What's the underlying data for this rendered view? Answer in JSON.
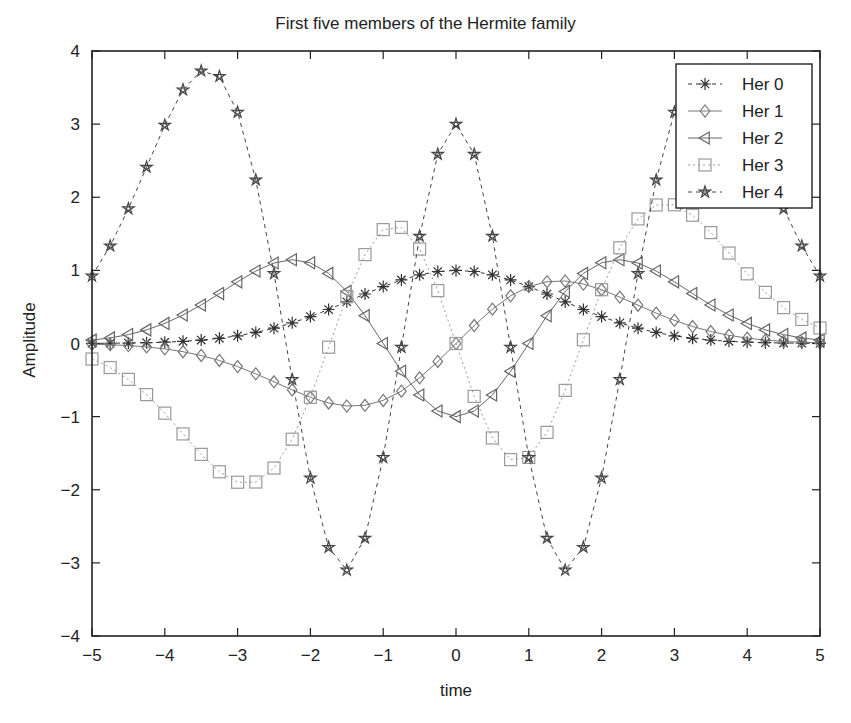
{
  "chart_data": {
    "type": "line",
    "title": "First five members of the Hermite family",
    "xlabel": "time",
    "ylabel": "Amplitude",
    "xlim": [
      -5,
      5
    ],
    "ylim": [
      -4,
      4
    ],
    "xticks": [
      -5,
      -4,
      -3,
      -2,
      -1,
      0,
      1,
      2,
      3,
      4,
      5
    ],
    "yticks": [
      -4,
      -3,
      -2,
      -1,
      0,
      1,
      2,
      3,
      4
    ],
    "xtick_labels": [
      "−5",
      "−4",
      "−3",
      "−2",
      "−1",
      "0",
      "1",
      "2",
      "3",
      "4",
      "5"
    ],
    "ytick_labels": [
      "−4",
      "−3",
      "−2",
      "−1",
      "0",
      "1",
      "2",
      "3",
      "4"
    ],
    "grid": false,
    "legend_position": "upper right",
    "x": [
      -5,
      -4.75,
      -4.5,
      -4.25,
      -4,
      -3.75,
      -3.5,
      -3.25,
      -3,
      -2.75,
      -2.5,
      -2.25,
      -2,
      -1.75,
      -1.5,
      -1.25,
      -1,
      -0.75,
      -0.5,
      -0.25,
      0,
      0.25,
      0.5,
      0.75,
      1,
      1.25,
      1.5,
      1.75,
      2,
      2.25,
      2.5,
      2.75,
      3,
      3.25,
      3.5,
      3.75,
      4,
      4.25,
      4.5,
      4.75,
      5
    ],
    "series": [
      {
        "name": "Her 0",
        "marker": "asterisk",
        "line": "dashed",
        "color": "#333333",
        "values": [
          0.0019,
          0.0035,
          0.0063,
          0.0109,
          0.0183,
          0.0298,
          0.0468,
          0.0714,
          0.1054,
          0.151,
          0.2096,
          0.2821,
          0.3679,
          0.4648,
          0.5698,
          0.6766,
          0.7788,
          0.8688,
          0.9394,
          0.9845,
          1.0,
          0.9845,
          0.9394,
          0.8688,
          0.7788,
          0.6766,
          0.5698,
          0.4648,
          0.3679,
          0.2821,
          0.2096,
          0.151,
          0.1054,
          0.0714,
          0.0468,
          0.0298,
          0.0183,
          0.0109,
          0.0063,
          0.0035,
          0.0019
        ]
      },
      {
        "name": "Her 1",
        "marker": "diamond",
        "line": "solid",
        "color": "#777777",
        "values": [
          -0.0097,
          -0.0168,
          -0.0284,
          -0.0464,
          -0.0733,
          -0.1118,
          -0.1639,
          -0.2319,
          -0.3162,
          -0.4152,
          -0.524,
          -0.6346,
          -0.7358,
          -0.8135,
          -0.8547,
          -0.8458,
          -0.7788,
          -0.6516,
          -0.4697,
          -0.2461,
          0.0,
          0.2461,
          0.4697,
          0.6516,
          0.7788,
          0.8458,
          0.8547,
          0.8135,
          0.7358,
          0.6346,
          0.524,
          0.4152,
          0.3162,
          0.2319,
          0.1639,
          0.1118,
          0.0733,
          0.0464,
          0.0284,
          0.0168,
          0.0097
        ]
      },
      {
        "name": "Her 2",
        "marker": "triangle-left",
        "line": "solid",
        "color": "#666666",
        "values": [
          0.0463,
          0.0763,
          0.1217,
          0.1863,
          0.2748,
          0.3894,
          0.527,
          0.6823,
          0.8432,
          0.9908,
          1.1004,
          1.1458,
          1.1036,
          0.9587,
          0.7122,
          0.3806,
          0.0,
          -0.3801,
          -0.7046,
          -0.923,
          -1.0,
          -0.923,
          -0.7046,
          -0.3801,
          0.0,
          0.3806,
          0.7122,
          0.9587,
          1.1036,
          1.1458,
          1.1004,
          0.9908,
          0.8432,
          0.6823,
          0.527,
          0.3894,
          0.2748,
          0.1863,
          0.1217,
          0.0763,
          0.0463
        ]
      },
      {
        "name": "Her 3",
        "marker": "square",
        "line": "dotted",
        "color": "#9a9a9a",
        "values": [
          -0.2123,
          -0.3289,
          -0.4906,
          -0.6991,
          -0.9526,
          -1.2367,
          -1.5164,
          -1.7539,
          -1.8972,
          -1.8942,
          -1.7031,
          -1.3089,
          -0.7358,
          -0.0508,
          0.641,
          1.2158,
          1.5576,
          1.5883,
          1.2917,
          0.723,
          0.0,
          -0.723,
          -1.2917,
          -1.5883,
          -1.5576,
          -1.2158,
          -0.641,
          0.0508,
          0.7358,
          1.3089,
          1.7031,
          1.8942,
          1.8972,
          1.7539,
          1.5164,
          1.2367,
          0.9526,
          0.6991,
          0.4906,
          0.3289,
          0.2123
        ]
      },
      {
        "name": "Her 4",
        "marker": "pentagram",
        "line": "dashed",
        "color": "#444444",
        "values": [
          0.9226,
          1.3341,
          1.8429,
          2.4117,
          2.9862,
          3.4693,
          3.7268,
          3.653,
          3.1621,
          2.2368,
          0.9563,
          -0.4925,
          -1.8394,
          -2.7872,
          -3.0982,
          -2.6616,
          -1.5576,
          -0.0509,
          1.4678,
          2.5882,
          3.0,
          2.5882,
          1.4678,
          -0.0509,
          -1.5576,
          -2.6616,
          -3.0982,
          -2.7872,
          -1.8394,
          -0.4925,
          0.9563,
          2.2368,
          3.1621,
          3.653,
          3.7268,
          3.4693,
          2.9862,
          2.4117,
          1.8429,
          1.3341,
          0.9226
        ]
      }
    ]
  }
}
